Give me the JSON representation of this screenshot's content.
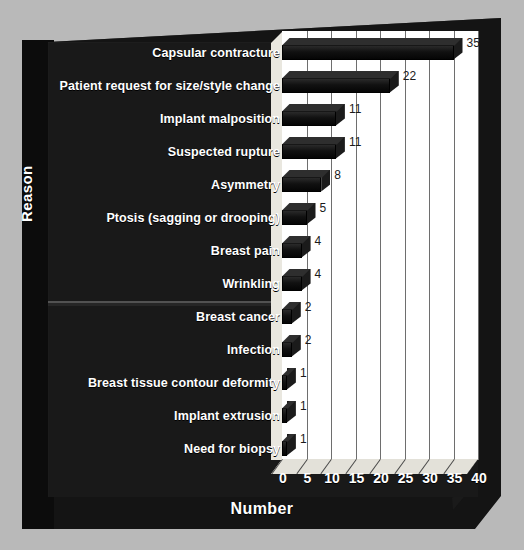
{
  "chart_data": {
    "type": "bar",
    "orientation": "horizontal",
    "title": "",
    "xlabel": "Number",
    "ylabel": "Reason",
    "xlim": [
      0,
      40
    ],
    "xticks": [
      0,
      5,
      10,
      15,
      20,
      25,
      30,
      35,
      40
    ],
    "grid": true,
    "legend": "none",
    "categories": [
      "Capsular contracture",
      "Patient request for size/style change",
      "Implant malposition",
      "Suspected rupture",
      "Asymmetry",
      "Ptosis (sagging or drooping)",
      "Breast pain",
      "Wrinkling",
      "Breast cancer",
      "Infection",
      "Breast tissue contour deformity",
      "Implant extrusion",
      "Need for biopsy"
    ],
    "values": [
      35,
      22,
      11,
      11,
      8,
      5,
      4,
      4,
      2,
      2,
      1,
      1,
      1
    ],
    "data_labels": [
      "35",
      "22",
      "11",
      "11",
      "8",
      "5",
      "4",
      "4",
      "2",
      "2",
      "1",
      "1",
      "1"
    ]
  },
  "style": {
    "page_background": "#b9b9b9",
    "panel_background": "#191919",
    "plot_background": "#ffffff",
    "bar_color": "#111111",
    "label_color": "#ffffff",
    "value_label_color": "#1a1a1a",
    "gridline_color": "#6e6e6e"
  }
}
